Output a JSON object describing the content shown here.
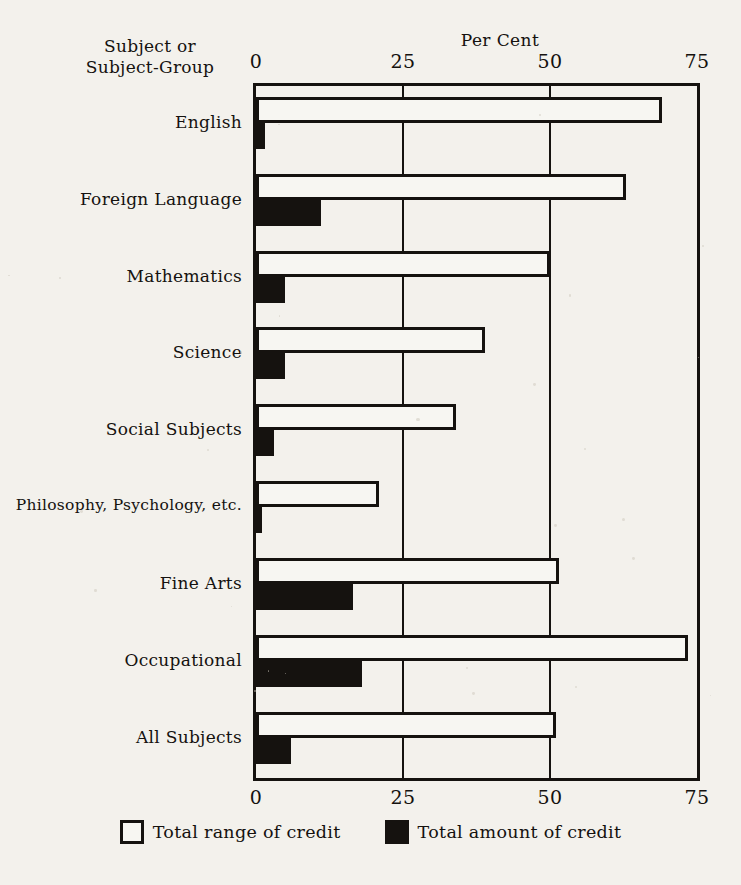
{
  "corner_label": "Subject or\nSubject-Group",
  "corner_label_line1": "Subject or",
  "corner_label_line2": "Subject-Group",
  "chart_data": {
    "type": "bar",
    "orientation": "horizontal",
    "title": "Per Cent",
    "xlabel": "Per Cent",
    "ylabel": "Subject or Subject-Group",
    "xlim": [
      0,
      75
    ],
    "xticks": [
      "0",
      "25",
      "50",
      "75"
    ],
    "xtick_values": [
      0,
      25,
      50,
      75
    ],
    "grid": true,
    "legend_position": "bottom",
    "categories": [
      "English",
      "Foreign Language",
      "Mathematics",
      "Science",
      "Social Subjects",
      "Philosophy, Psychology, etc.",
      "Fine Arts",
      "Occupational",
      "All Subjects"
    ],
    "series": [
      {
        "name": "Total range of credit",
        "color": "#ffffff",
        "values": [
          69,
          63,
          50,
          39,
          34,
          21,
          51.5,
          73.5,
          51
        ]
      },
      {
        "name": "Total amount of credit",
        "color": "#15120f",
        "values": [
          1.5,
          11,
          5,
          5,
          3,
          1,
          16.5,
          18,
          6
        ]
      }
    ]
  },
  "legend": [
    {
      "swatch": "open-square-icon",
      "label": "Total range of credit"
    },
    {
      "swatch": "filled-square-icon",
      "label": "Total amount of credit"
    }
  ]
}
